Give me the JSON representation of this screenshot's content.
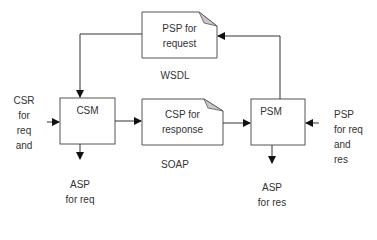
{
  "diagram": {
    "nodes": {
      "psp_request": {
        "line1": "PSP for",
        "line2": "request"
      },
      "csm": {
        "label": "CSM"
      },
      "csp_response": {
        "line1": "CSP for",
        "line2": "response"
      },
      "psm": {
        "label": "PSM"
      }
    },
    "labels": {
      "wsdl": "WSDL",
      "soap": "SOAP",
      "csr_input": [
        "CSR",
        "for",
        "req",
        "and"
      ],
      "psp_input": [
        "PSP",
        "for req",
        "and",
        "res"
      ],
      "asp_req": [
        "ASP",
        "for req"
      ],
      "asp_res": [
        "ASP",
        "for res"
      ]
    },
    "colors": {
      "stroke": "#555555",
      "fold": "#c8c8c8",
      "text": "#333333"
    }
  }
}
